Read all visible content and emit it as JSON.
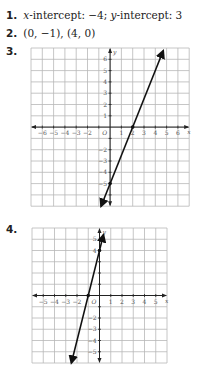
{
  "answers": [
    {
      "number": "1.",
      "x_label": "x",
      "x_text": "-intercept: −4; ",
      "y_label": "y",
      "y_text": "-intercept: 3"
    },
    {
      "number": "2.",
      "text": "(0, −1), (4, 0)"
    },
    {
      "number": "3."
    },
    {
      "number": "4."
    }
  ],
  "chart_data": [
    {
      "type": "line",
      "title": "3.",
      "xlabel": "x",
      "ylabel": "y",
      "xlim": [
        -7,
        7
      ],
      "ylim": [
        -7,
        7
      ],
      "grid": true,
      "x_tick_labels": [
        "−6",
        "−5",
        "−4",
        "−3",
        "−2",
        "1",
        "2",
        "3",
        "4",
        "5",
        "6"
      ],
      "y_tick_labels": [
        "6",
        "5",
        "4",
        "3",
        "2",
        "1",
        "−2",
        "−3",
        "−4",
        "−5"
      ],
      "origin_label": "O",
      "points": [
        {
          "x": 0,
          "y": -5
        },
        {
          "x": 2,
          "y": 0
        }
      ],
      "line": {
        "slope": 2.5,
        "intercept": -5,
        "x_start": -0.8,
        "x_end": 4.7
      },
      "line_color": "#111111"
    },
    {
      "type": "line",
      "title": "4.",
      "xlabel": "x",
      "ylabel": "y",
      "xlim": [
        -6,
        6
      ],
      "ylim": [
        -6,
        6
      ],
      "grid": true,
      "x_tick_labels": [
        "−5",
        "−4",
        "−3",
        "−2",
        "1",
        "2",
        "3",
        "4",
        "5"
      ],
      "y_tick_labels": [
        "5",
        "4",
        "−2",
        "−3",
        "−4",
        "−5"
      ],
      "origin_label": "O",
      "points": [
        {
          "x": -1,
          "y": 0
        },
        {
          "x": 0,
          "y": 4
        }
      ],
      "line": {
        "slope": 4,
        "intercept": 4,
        "x_start": -2.5,
        "x_end": 0.35
      },
      "line_color": "#111111"
    }
  ]
}
